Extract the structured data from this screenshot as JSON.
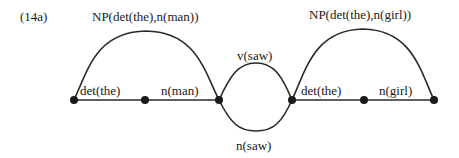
{
  "example_label": "(14a)",
  "nodes": [
    {
      "id": "n0",
      "x": 74,
      "y": 100
    },
    {
      "id": "n1",
      "x": 145,
      "y": 100
    },
    {
      "id": "n2",
      "x": 219,
      "y": 100
    },
    {
      "id": "n3",
      "x": 292,
      "y": 100
    },
    {
      "id": "n4",
      "x": 364,
      "y": 100
    },
    {
      "id": "n5",
      "x": 434,
      "y": 100
    }
  ],
  "edges": {
    "det1": {
      "label": "det(the)",
      "from": "n0",
      "to": "n1"
    },
    "n_man": {
      "label": "n(man)",
      "from": "n1",
      "to": "n2"
    },
    "np1": {
      "label": "NP(det(the),n(man))",
      "from": "n0",
      "to": "n2"
    },
    "v_saw": {
      "label": "v(saw)",
      "from": "n2",
      "to": "n3"
    },
    "n_saw": {
      "label": "n(saw)",
      "from": "n2",
      "to": "n3"
    },
    "det2": {
      "label": "det(the)",
      "from": "n3",
      "to": "n4"
    },
    "n_girl": {
      "label": "n(girl)",
      "from": "n4",
      "to": "n5"
    },
    "np2": {
      "label": "NP(det(the),n(girl))",
      "from": "n3",
      "to": "n5"
    }
  }
}
